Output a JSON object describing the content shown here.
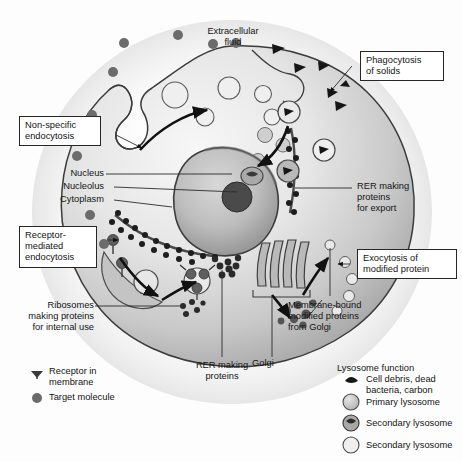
{
  "figure": {
    "background_color": "#fdfdfd",
    "ink_color": "#141414"
  },
  "annotations": {
    "extracellular_fluid": "Extracellular\nfluid",
    "non_specific_endocytosis": "Non-specific\nendocytosis",
    "phagocytosis_of_solids": "Phagocytosis\nof solids",
    "nucleus": "Nucleus",
    "nucleolus": "Nucleolus",
    "cytoplasm": "Cytoplasm",
    "rer_export": "RER making\nproteins\nfor export",
    "receptor_mediated_endocytosis": "Receptor-\nmediated\nendocytosis",
    "exocytosis_modified_protein": "Exocytosis of\nmodified protein",
    "ribosomes_internal": "Ribosomes\nmaking proteins\nfor internal use",
    "rer_making_proteins": "RER making\nproteins",
    "golgi": "Golgi",
    "membrane_bound_proteins": "Membrane-bound\nmodified proteins\nfrom Golgi"
  },
  "legend_left": {
    "items": [
      {
        "icon": "receptor-glyph",
        "label": "Receptor in\nmembrane"
      },
      {
        "icon": "filled-circle-glyph",
        "label": "Target molecule"
      }
    ]
  },
  "legend_right": {
    "title": "Lysosome function",
    "items": [
      {
        "icon": "cell-debris-glyph",
        "label": "Cell debris, dead\nbacteria, carbon"
      },
      {
        "icon": "primary-lysosome-glyph",
        "label": "Primary lysosome"
      },
      {
        "icon": "secondary-lysosome-dark-glyph",
        "label": "Secondary lysosome"
      },
      {
        "icon": "secondary-lysosome-light-glyph",
        "label": "Secondary lysosome"
      }
    ]
  },
  "colors": {
    "cytoplasm_light": "#efefef",
    "cytoplasm_mid": "#cfcfcf",
    "cytoplasm_dark": "#9a9a9a",
    "membrane_stroke": "#3a3a3a",
    "nucleus_fill": "#b8b8b8",
    "nucleolus_fill": "#4c4c4c",
    "vesicle_fill": "#c8c8c8",
    "molecule_fill": "#6b6b6b"
  }
}
